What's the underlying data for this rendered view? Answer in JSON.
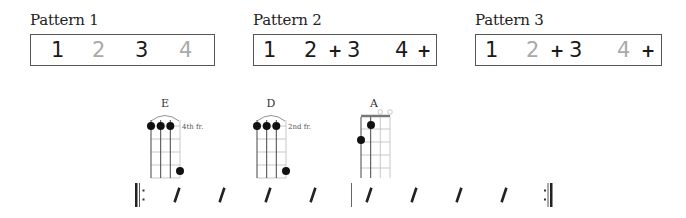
{
  "patterns": [
    {
      "label": "Pattern 1",
      "counts": [
        {
          "text": "1",
          "state": "on"
        },
        {
          "text": "2",
          "state": "off"
        },
        {
          "text": "3",
          "state": "on"
        },
        {
          "text": "4",
          "state": "off"
        }
      ]
    },
    {
      "label": "Pattern 2",
      "counts": [
        {
          "text": "1",
          "state": "on"
        },
        {
          "text": "2",
          "state": "on"
        },
        {
          "text": "+",
          "state": "plus"
        },
        {
          "text": "3",
          "state": "on"
        },
        {
          "text": "4",
          "state": "on"
        },
        {
          "text": "+",
          "state": "plus"
        }
      ]
    },
    {
      "label": "Pattern 3",
      "counts": [
        {
          "text": "1",
          "state": "on"
        },
        {
          "text": "2",
          "state": "off"
        },
        {
          "text": "+",
          "state": "plus"
        },
        {
          "text": "3",
          "state": "on"
        },
        {
          "text": "4",
          "state": "off"
        },
        {
          "text": "+",
          "state": "plus"
        }
      ]
    }
  ],
  "chords": [
    {
      "name": "E",
      "fret_label": "4th fr.",
      "barre_arc": true,
      "open_strings": [],
      "dots": [
        [
          1,
          1
        ],
        [
          2,
          1
        ],
        [
          3,
          1
        ],
        [
          4,
          4
        ]
      ]
    },
    {
      "name": "D",
      "fret_label": "2nd fr.",
      "barre_arc": true,
      "open_strings": [],
      "dots": [
        [
          1,
          1
        ],
        [
          2,
          1
        ],
        [
          3,
          1
        ],
        [
          4,
          4
        ]
      ]
    },
    {
      "name": "A",
      "fret_label": "",
      "barre_arc": false,
      "nut": true,
      "open_strings": [
        3,
        4
      ],
      "dots": [
        [
          1,
          2
        ],
        [
          2,
          1
        ]
      ]
    }
  ],
  "strum_line": {
    "start": "repeat-start",
    "end": "repeat-end",
    "bars": [
      {
        "slashes": 4
      },
      {
        "slashes": 4
      }
    ]
  },
  "colors": {
    "active_count": "#1a1a1a",
    "muted_count": "#a9a9a9",
    "box_border": "#555555"
  }
}
